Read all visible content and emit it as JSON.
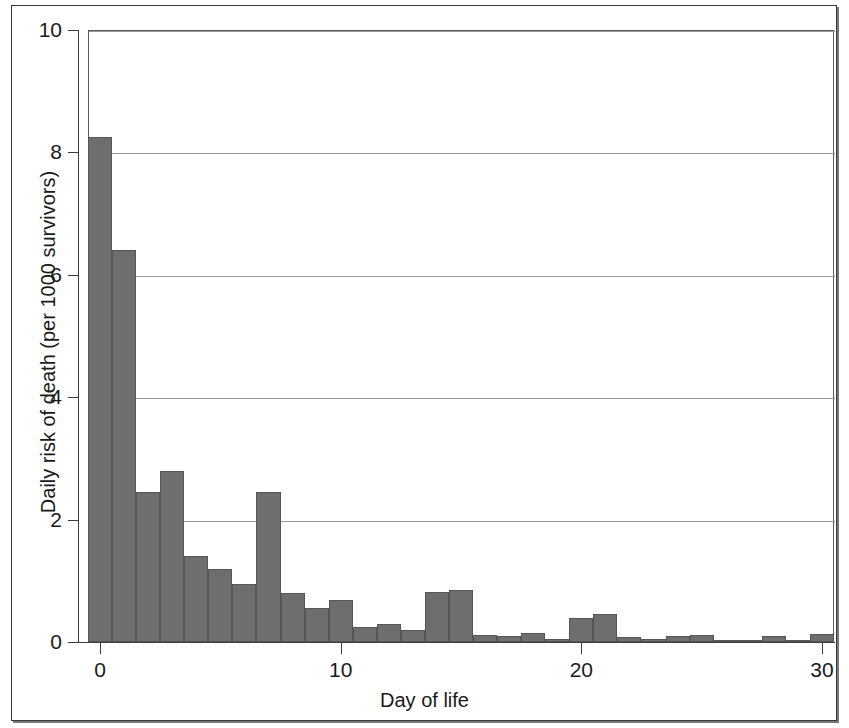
{
  "chart_data": {
    "type": "bar",
    "title": "",
    "subtitle": "",
    "xlabel": "Day of life",
    "ylabel": "Daily risk of death (per 1000 survivors)",
    "xlim": [
      -0.5,
      30.5
    ],
    "ylim": [
      0,
      10
    ],
    "grid": "horizontal",
    "legend": "none",
    "bar_color": "#6e6e6e",
    "bar_edge_color": "#565656",
    "x_ticks": [
      0,
      10,
      20,
      30
    ],
    "x_tick_labels": [
      "0",
      "10",
      "20",
      "30"
    ],
    "y_ticks": [
      0,
      2,
      4,
      6,
      8,
      10
    ],
    "y_tick_labels": [
      "0",
      "2",
      "4",
      "6",
      "8",
      "10"
    ],
    "categories": [
      0,
      1,
      2,
      3,
      4,
      5,
      6,
      7,
      8,
      9,
      10,
      11,
      12,
      13,
      14,
      15,
      16,
      17,
      18,
      19,
      20,
      21,
      22,
      23,
      24,
      25,
      26,
      27,
      28,
      29,
      30
    ],
    "values": [
      8.25,
      6.4,
      2.45,
      2.8,
      1.4,
      1.2,
      0.95,
      2.45,
      0.8,
      0.55,
      0.68,
      0.25,
      0.3,
      0.2,
      0.82,
      0.85,
      0.12,
      0.1,
      0.15,
      0.05,
      0.4,
      0.45,
      0.08,
      0.05,
      0.1,
      0.12,
      0.03,
      0.02,
      0.1,
      0.03,
      0.13
    ],
    "annotations": []
  }
}
